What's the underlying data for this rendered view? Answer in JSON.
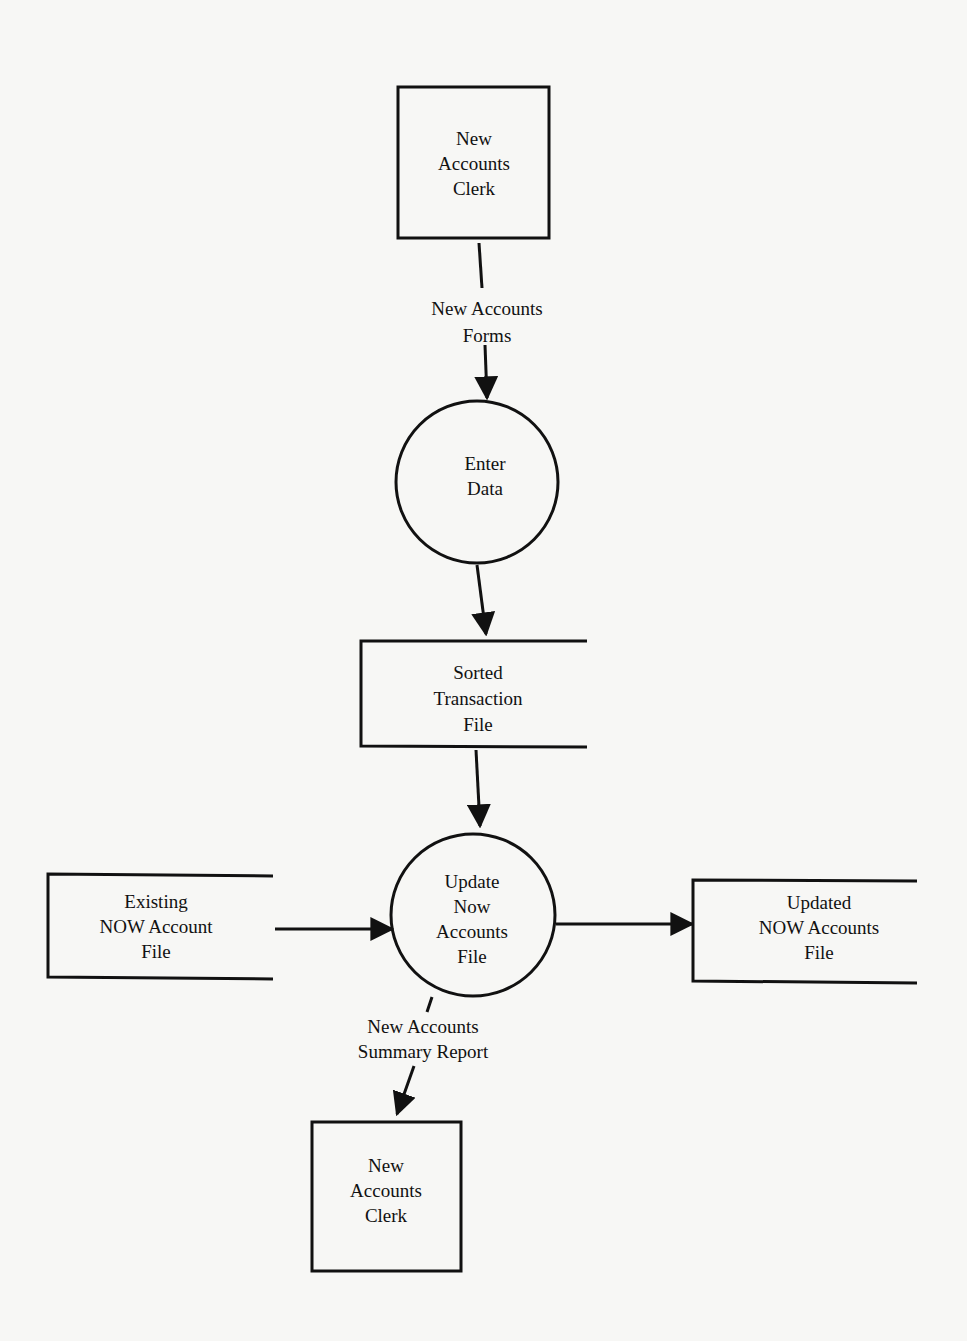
{
  "diagram": {
    "type": "data-flow-diagram",
    "nodes": [
      {
        "id": "clerk_top",
        "kind": "external-entity",
        "lines": [
          "New",
          "Accounts",
          "Clerk"
        ]
      },
      {
        "id": "enter_data",
        "kind": "process",
        "lines": [
          "Enter",
          "Data"
        ]
      },
      {
        "id": "sorted_file",
        "kind": "data-store",
        "lines": [
          "Sorted",
          "Transaction",
          "File"
        ]
      },
      {
        "id": "update_process",
        "kind": "process",
        "lines": [
          "Update",
          "Now",
          "Accounts",
          "File"
        ]
      },
      {
        "id": "existing_file",
        "kind": "data-store",
        "lines": [
          "Existing",
          "NOW Account",
          "File"
        ]
      },
      {
        "id": "updated_file",
        "kind": "data-store",
        "lines": [
          "Updated",
          "NOW Accounts",
          "File"
        ]
      },
      {
        "id": "clerk_bottom",
        "kind": "external-entity",
        "lines": [
          "New",
          "Accounts",
          "Clerk"
        ]
      }
    ],
    "flows": [
      {
        "from": "clerk_top",
        "to": "enter_data",
        "lines": [
          "New Accounts",
          "Forms"
        ]
      },
      {
        "from": "enter_data",
        "to": "sorted_file",
        "lines": []
      },
      {
        "from": "sorted_file",
        "to": "update_process",
        "lines": []
      },
      {
        "from": "existing_file",
        "to": "update_process",
        "lines": []
      },
      {
        "from": "update_process",
        "to": "updated_file",
        "lines": []
      },
      {
        "from": "update_process",
        "to": "clerk_bottom",
        "lines": [
          "New Accounts",
          "Summary Report"
        ]
      }
    ]
  }
}
